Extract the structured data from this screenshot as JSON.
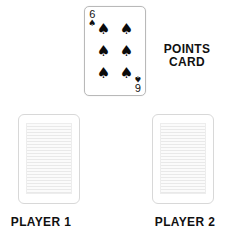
{
  "canvas": {
    "width": 226,
    "height": 233,
    "background": "#ffffff"
  },
  "points_card": {
    "rank": "6",
    "suit_symbol": "♠",
    "suit_name": "spades",
    "pip_count": 6,
    "pips": [
      "♠",
      "♠",
      "♠",
      "♠",
      "♠",
      "♠"
    ],
    "face_up": true,
    "border_color": "#b9b9b9",
    "pip_color": "#0b0b0b"
  },
  "points_label": {
    "line1": "POINTS",
    "line2": "CARD",
    "color": "#101010"
  },
  "player_cards": [
    {
      "owner": "player-1",
      "face_up": false,
      "label": "PLAYER 1",
      "border_color": "#d8d8d8",
      "back_color": "#f2f2f2"
    },
    {
      "owner": "player-2",
      "face_up": false,
      "label": "PLAYER 2",
      "border_color": "#d8d8d8",
      "back_color": "#f2f2f2"
    }
  ]
}
